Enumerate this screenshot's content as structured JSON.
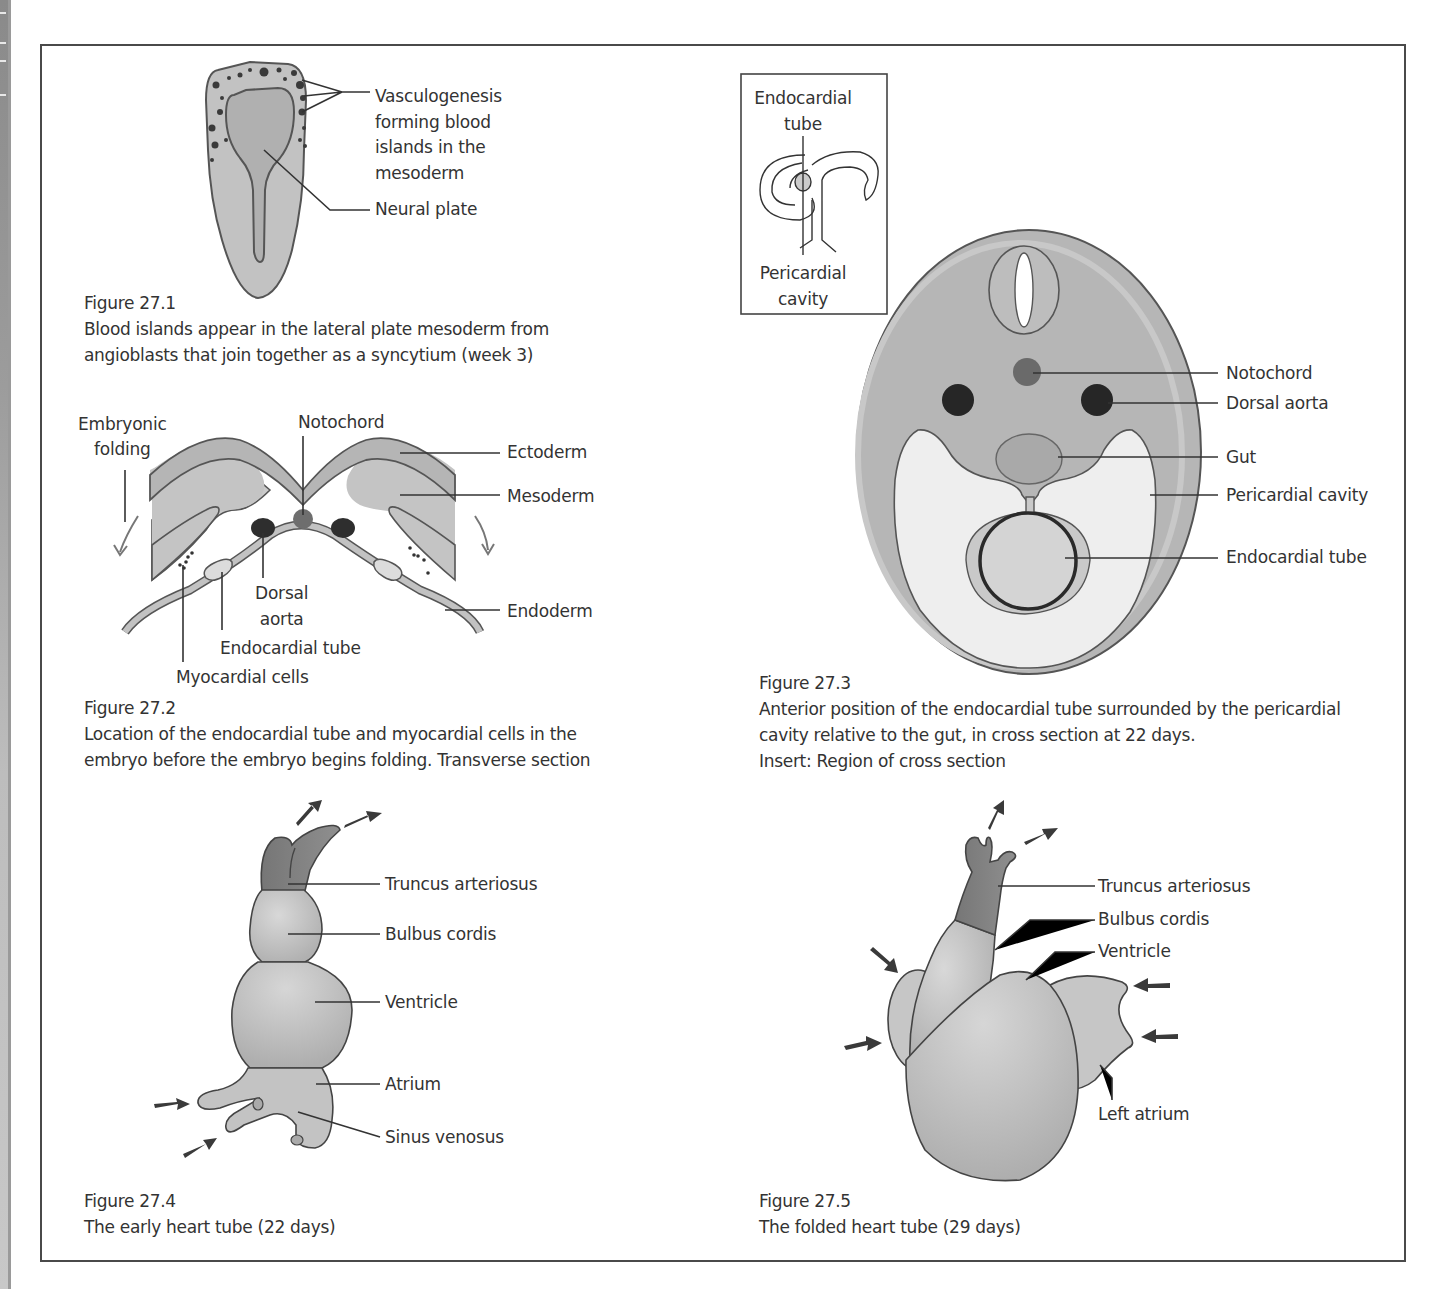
{
  "page": {
    "type": "textbook figure page"
  },
  "figures": [
    {
      "id": "fig27_1",
      "number": "Figure 27.1",
      "caption": "Blood islands appear in the lateral plate mesoderm from\nangioblasts that join together as a syncytium (week 3)",
      "labels": {
        "vasculogenesis": "Vasculogenesis\nforming blood\nislands in the\nmesoderm",
        "neural_plate": "Neural plate"
      }
    },
    {
      "id": "fig27_2",
      "number": "Figure 27.2",
      "caption": "Location of the endocardial tube and myocardial cells in the\nembryo before the embryo begins folding. Transverse section",
      "labels": {
        "embryonic_folding": "Embryonic\nfolding",
        "notochord": "Notochord",
        "ectoderm": "Ectoderm",
        "mesoderm": "Mesoderm",
        "dorsal_aorta": "Dorsal\naorta",
        "endoderm": "Endoderm",
        "endocardial_tube": "Endocardial tube",
        "myocardial_cells": "Myocardial cells"
      }
    },
    {
      "id": "fig27_3",
      "number": "Figure 27.3",
      "caption": "Anterior position of the endocardial tube surrounded by the pericardial\ncavity relative to the gut, in cross section at 22 days.\nInsert: Region of cross section",
      "insert": {
        "endocardial_tube": "Endocardial\ntube",
        "pericardial_cavity": "Pericardial\ncavity"
      },
      "labels": {
        "notochord": "Notochord",
        "dorsal_aorta": "Dorsal aorta",
        "gut": "Gut",
        "pericardial_cavity": "Pericardial cavity",
        "endocardial_tube": "Endocardial tube"
      }
    },
    {
      "id": "fig27_4",
      "number": "Figure 27.4",
      "caption": "The early heart tube (22 days)",
      "labels": {
        "truncus_arteriosus": "Truncus arteriosus",
        "bulbus_cordis": "Bulbus cordis",
        "ventricle": "Ventricle",
        "atrium": "Atrium",
        "sinus_venosus": "Sinus venosus"
      }
    },
    {
      "id": "fig27_5",
      "number": "Figure 27.5",
      "caption": "The folded heart tube (29 days)",
      "labels": {
        "truncus_arteriosus": "Truncus arteriosus",
        "bulbus_cordis": "Bulbus cordis",
        "ventricle": "Ventricle",
        "left_atrium": "Left atrium"
      }
    }
  ],
  "colors": {
    "tissue_light": "#c9c9c9",
    "tissue_mid": "#b3b3b3",
    "tissue_dark": "#8c8c8c",
    "vessel_dark": "#2f2f2f",
    "notochord": "#6e6e6e",
    "cavity": "#efefef",
    "line": "#333333",
    "frame": "#4a4a4a"
  }
}
